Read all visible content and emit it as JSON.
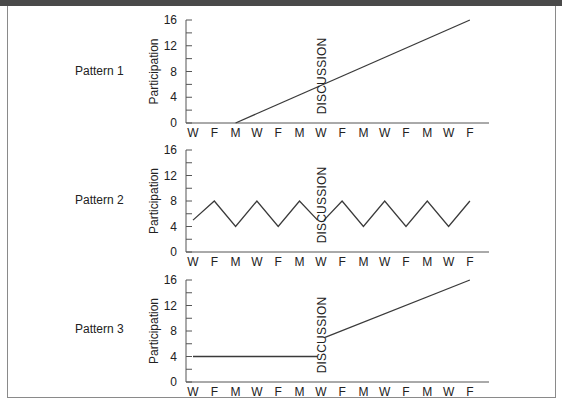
{
  "chart_data": [
    {
      "type": "line",
      "title": "Pattern 1",
      "xlabel": "",
      "ylabel": "Participation",
      "categories": [
        "W",
        "F",
        "M",
        "W",
        "F",
        "M",
        "W",
        "F",
        "M",
        "W",
        "F",
        "M",
        "W",
        "F"
      ],
      "ylim": [
        0,
        16
      ],
      "yticks": [
        0,
        4,
        8,
        12,
        16
      ],
      "annotation": {
        "text": "DISCUSSION",
        "x_index": 6
      },
      "series": [
        {
          "name": "Participation",
          "segments": [
            {
              "x": [
                2,
                13
              ],
              "y": [
                0,
                16
              ]
            }
          ]
        }
      ]
    },
    {
      "type": "line",
      "title": "Pattern 2",
      "xlabel": "",
      "ylabel": "Participation",
      "categories": [
        "W",
        "F",
        "M",
        "W",
        "F",
        "M",
        "W",
        "F",
        "M",
        "W",
        "F",
        "M",
        "W",
        "F"
      ],
      "ylim": [
        0,
        16
      ],
      "yticks": [
        0,
        4,
        8,
        12,
        16
      ],
      "annotation": {
        "text": "DISCUSSION",
        "x_index": 6
      },
      "series": [
        {
          "name": "Participation",
          "segments": [
            {
              "x": [
                0,
                1,
                2,
                3,
                4,
                5,
                5.85
              ],
              "y": [
                5,
                8,
                4,
                8,
                4,
                8,
                5
              ]
            },
            {
              "x": [
                6.15,
                7,
                8,
                9,
                10,
                11,
                12,
                13
              ],
              "y": [
                5,
                8,
                4,
                8,
                4,
                8,
                4,
                8
              ]
            }
          ]
        }
      ]
    },
    {
      "type": "line",
      "title": "Pattern 3",
      "xlabel": "",
      "ylabel": "Participation",
      "categories": [
        "W",
        "F",
        "M",
        "W",
        "F",
        "M",
        "W",
        "F",
        "M",
        "W",
        "F",
        "M",
        "W",
        "F"
      ],
      "ylim": [
        0,
        16
      ],
      "yticks": [
        0,
        4,
        8,
        12,
        16
      ],
      "annotation": {
        "text": "DISCUSSION",
        "x_index": 6
      },
      "series": [
        {
          "name": "Participation",
          "segments": [
            {
              "x": [
                0,
                5.85
              ],
              "y": [
                4,
                4
              ]
            },
            {
              "x": [
                6.2,
                13
              ],
              "y": [
                7,
                16
              ]
            }
          ]
        }
      ]
    }
  ],
  "panels": [
    {
      "label": "Pattern 1",
      "ylabel": "Participation",
      "discussion": "DISCUSSION"
    },
    {
      "label": "Pattern 2",
      "ylabel": "Participation",
      "discussion": "DISCUSSION"
    },
    {
      "label": "Pattern 3",
      "ylabel": "Participation",
      "discussion": "DISCUSSION"
    }
  ],
  "colors": {
    "line": "#3a3a3a",
    "axis": "#555555",
    "frame": "#8a8a8a",
    "topbar": "#4a4a4a"
  }
}
